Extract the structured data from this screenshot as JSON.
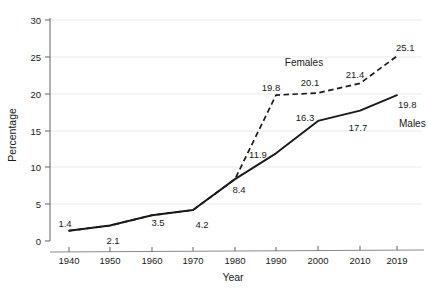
{
  "chart_data": {
    "type": "line",
    "title": "",
    "xlabel": "Year",
    "ylabel": "Percentage",
    "x": [
      "1940",
      "1950",
      "1960",
      "1970",
      "1980",
      "1990",
      "2000",
      "2010",
      "2019"
    ],
    "xlim": [
      1940,
      2019
    ],
    "ylim": [
      0,
      30
    ],
    "yticks": [
      "0",
      "5",
      "10",
      "15",
      "20",
      "25",
      "30"
    ],
    "grid": "horizontal",
    "legend_position": "inline-annotations",
    "series": [
      {
        "name": "Females",
        "style": "dashed",
        "color": "#1a1a1a",
        "values": [
          1.4,
          2.1,
          3.5,
          4.2,
          8.4,
          19.8,
          20.1,
          21.4,
          25.1
        ],
        "labels": [
          "",
          "",
          "",
          "",
          "",
          "19.8",
          "20.1",
          "21.4",
          "25.1"
        ]
      },
      {
        "name": "Males",
        "style": "solid",
        "color": "#1a1a1a",
        "values": [
          1.4,
          2.1,
          3.5,
          4.2,
          8.4,
          11.9,
          16.3,
          17.7,
          19.8
        ],
        "labels": [
          "1.4",
          "2.1",
          "3.5",
          "4.2",
          "8.4",
          "11.9",
          "16.3",
          "17.7",
          "19.8"
        ]
      }
    ],
    "annotations": [
      {
        "text": "Females",
        "x": 1986,
        "y": 24.9
      },
      {
        "text": "Males",
        "x": 2012,
        "y": 16.0
      }
    ],
    "point_labels": [
      {
        "text": "1.4",
        "x": 65,
        "y": 227,
        "anchor": "middle"
      },
      {
        "text": "2.1",
        "x": 113,
        "y": 244,
        "anchor": "middle"
      },
      {
        "text": "3.5",
        "x": 158,
        "y": 226,
        "anchor": "middle"
      },
      {
        "text": "4.2",
        "x": 202,
        "y": 228,
        "anchor": "middle"
      },
      {
        "text": "8.4",
        "x": 239,
        "y": 193,
        "anchor": "middle"
      },
      {
        "text": "11.9",
        "x": 258,
        "y": 158,
        "anchor": "middle"
      },
      {
        "text": "16.3",
        "x": 305,
        "y": 121,
        "anchor": "middle"
      },
      {
        "text": "17.7",
        "x": 358,
        "y": 131,
        "anchor": "middle"
      },
      {
        "text": "19.8",
        "x": 398,
        "y": 108,
        "anchor": "start"
      },
      {
        "text": "19.8",
        "x": 271,
        "y": 91,
        "anchor": "middle"
      },
      {
        "text": "20.1",
        "x": 310,
        "y": 86,
        "anchor": "middle"
      },
      {
        "text": "21.4",
        "x": 355,
        "y": 78,
        "anchor": "middle"
      },
      {
        "text": "25.1",
        "x": 396,
        "y": 51,
        "anchor": "start"
      }
    ],
    "colors": {
      "line": "#1a1a1a",
      "grid": "#e8e8e8",
      "axis": "#6f6f6f",
      "text": "#1a1a1a"
    }
  }
}
